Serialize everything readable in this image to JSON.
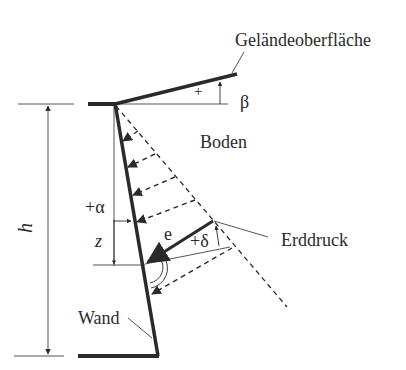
{
  "diagram": {
    "colors": {
      "ink": "#2a2a2a",
      "background": "#ffffff"
    },
    "labels": {
      "ground_surface": "Geländeoberfläche",
      "soil": "Boden",
      "earth_pressure": "Erddruck",
      "wall": "Wand",
      "height": "h",
      "depth": "z",
      "wall_angle": "+α",
      "friction_angle": "+δ",
      "slope_angle": "β",
      "slope_sign": "+",
      "pressure_vector": "e"
    },
    "elements": [
      {
        "id": "wall",
        "type": "thick-line",
        "from": [
          115,
          104
        ],
        "to": [
          158,
          356
        ]
      },
      {
        "id": "ground-surface",
        "type": "thick-line",
        "from": [
          115,
          104
        ],
        "to": [
          237,
          74
        ]
      },
      {
        "id": "top-ledge",
        "type": "thick-line",
        "from": [
          88,
          104
        ],
        "to": [
          115,
          104
        ]
      },
      {
        "id": "base",
        "type": "thick-line",
        "from": [
          78,
          356
        ],
        "to": [
          158,
          356
        ]
      },
      {
        "id": "pressure-envelope",
        "type": "dashed-line",
        "from": [
          115,
          104
        ],
        "to": [
          287,
          307
        ]
      },
      {
        "id": "height-dimension",
        "type": "dimension",
        "x": 48,
        "from_y": 104,
        "to_y": 356
      }
    ]
  }
}
